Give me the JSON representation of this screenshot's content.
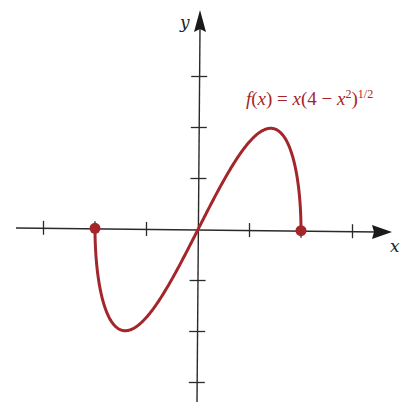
{
  "chart_data": {
    "type": "line",
    "title": "",
    "function_label": "f(x) = x(4 − x²)^{1/2}",
    "function_label_parts": {
      "f": "f",
      "open": "(",
      "x1": "x",
      "close_eq": ") = ",
      "x2": "x",
      "mid": "(4 − ",
      "x3": "x",
      "sq": "2",
      "close": ")",
      "exp": "1/2"
    },
    "xlabel": "x",
    "ylabel": "y",
    "xlim": [
      -3.5,
      3.8
    ],
    "ylim": [
      -3.2,
      4.2
    ],
    "x_ticks": [
      -3,
      -2,
      -1,
      1,
      2,
      3
    ],
    "y_ticks": [
      -3,
      -2,
      -1,
      1,
      2,
      3
    ],
    "tick_labels_shown": false,
    "grid": false,
    "domain": [
      -2,
      2
    ],
    "endpoints": [
      {
        "x": -2,
        "y": 0,
        "marker": "filled-circle"
      },
      {
        "x": 2,
        "y": 0,
        "marker": "filled-circle"
      }
    ],
    "extrema": [
      {
        "type": "max",
        "x": 1.414,
        "y": 2
      },
      {
        "type": "min",
        "x": -1.414,
        "y": -2
      }
    ],
    "series": [
      {
        "name": "f(x) = x(4 − x²)^{1/2}",
        "color": "#a3262b",
        "x": [
          -2,
          -1.99,
          -1.95,
          -1.9,
          -1.8,
          -1.6,
          -1.414,
          -1.2,
          -1.0,
          -0.6,
          0,
          0.6,
          1.0,
          1.2,
          1.414,
          1.6,
          1.8,
          1.9,
          1.95,
          1.99,
          2
        ],
        "y": [
          0,
          -0.398,
          -0.866,
          -1.186,
          -1.569,
          -1.92,
          -2.0,
          -1.92,
          -1.732,
          -1.145,
          0,
          1.145,
          1.732,
          1.92,
          2.0,
          1.92,
          1.569,
          1.186,
          0.866,
          0.398,
          0
        ]
      }
    ],
    "colors": {
      "curve": "#a3262b",
      "axes": "#2a2a2a",
      "background": "#ffffff"
    }
  }
}
